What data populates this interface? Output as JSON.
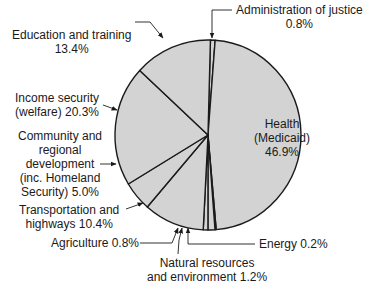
{
  "chart_data": {
    "type": "pie",
    "title": "",
    "slices": [
      {
        "label": "Administration of justice",
        "value": 0.8
      },
      {
        "label": "Health (Medicaid)",
        "value": 46.9
      },
      {
        "label": "Energy",
        "value": 0.2
      },
      {
        "label": "Natural resources and environment",
        "value": 1.2
      },
      {
        "label": "Agriculture",
        "value": 0.8
      },
      {
        "label": "Transportation and highways",
        "value": 10.4
      },
      {
        "label": "Community and regional development (inc. Homeland Security)",
        "value": 5.0
      },
      {
        "label": "Income security (welfare)",
        "value": 20.3
      },
      {
        "label": "Education and training",
        "value": 13.4
      }
    ],
    "start_angle_deg": 0,
    "direction": "clockwise",
    "fill_color": "#d3d3d3",
    "stroke_color": "#1a1a1a",
    "legend": "none (callout labels)"
  },
  "labels": {
    "admin_1": "Administration of justice",
    "admin_2": "0.8%",
    "health_1": "Health",
    "health_2": "(Medicaid)",
    "health_3": "46.9%",
    "edu_1": "Education and training",
    "edu_2": "13.4%",
    "income_1": "Income security",
    "income_2": "(welfare) 20.3%",
    "comm_1": "Community and",
    "comm_2": "regional",
    "comm_3": "development",
    "comm_4": "(inc. Homeland",
    "comm_5": "Security) 5.0%",
    "trans_1": "Transportation and",
    "trans_2": "highways 10.4%",
    "agri": "Agriculture 0.8%",
    "energy": "Energy 0.2%",
    "nat_1": "Natural resources",
    "nat_2": "and environment 1.2%"
  }
}
